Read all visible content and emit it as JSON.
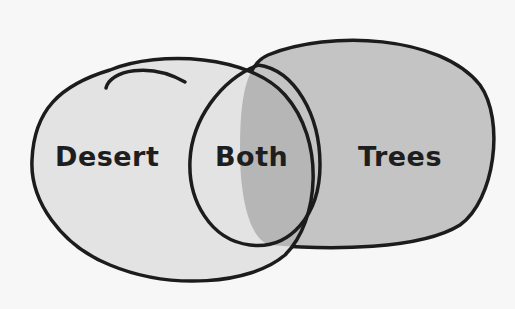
{
  "diagram": {
    "type": "venn",
    "sets": [
      {
        "name": "Desert",
        "label": "Desert",
        "fill": "#e3e3e3"
      },
      {
        "name": "Trees",
        "label": "Trees",
        "fill": "#c4c4c4"
      }
    ],
    "intersection": {
      "label": "Both",
      "fill": "#b6b6b6"
    },
    "outline_color": "#1c1c1c",
    "background": "#f7f7f7"
  }
}
